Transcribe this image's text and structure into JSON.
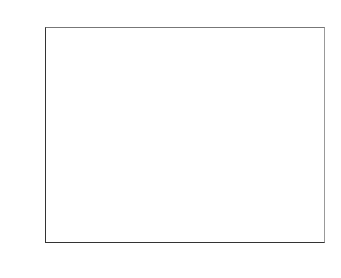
{
  "chart_data": {
    "type": "bar",
    "xlabel": "",
    "ylabel": "",
    "ylim": [
      0,
      250
    ],
    "yticks": [
      0,
      50,
      100,
      150,
      200,
      250
    ],
    "categories": [
      "nonane",
      "isopropanol",
      "hypnone"
    ],
    "legend_position": "upper right",
    "grid": false,
    "series": [
      {
        "name": "S1",
        "color": "#222222",
        "values": [
          7,
          6,
          7
        ]
      },
      {
        "name": "S2",
        "color": "#666666",
        "values": [
          20,
          20,
          42
        ]
      },
      {
        "name": "S3",
        "color": "#d4d4d4",
        "values": [
          41,
          41,
          128
        ]
      },
      {
        "name": "S4",
        "color": "#bdbdbd",
        "values": [
          243,
          125,
          197
        ]
      },
      {
        "name": "S5",
        "color": "#cfcfcf",
        "values": [
          42,
          31,
          126
        ]
      },
      {
        "name": "S6",
        "color": "#5f5f5f",
        "values": [
          243,
          118,
          229
        ]
      },
      {
        "name": "S7",
        "color": "#1a1a1a",
        "values": [
          35,
          58,
          71
        ]
      }
    ]
  },
  "labels": {
    "yticks": [
      "0",
      "50",
      "100",
      "150",
      "200",
      "250"
    ],
    "categories": [
      "nonane",
      "isopropanol",
      "hypnone"
    ],
    "legend": [
      "S1",
      "S2",
      "S3",
      "S4",
      "S5",
      "S6",
      "S7"
    ]
  }
}
